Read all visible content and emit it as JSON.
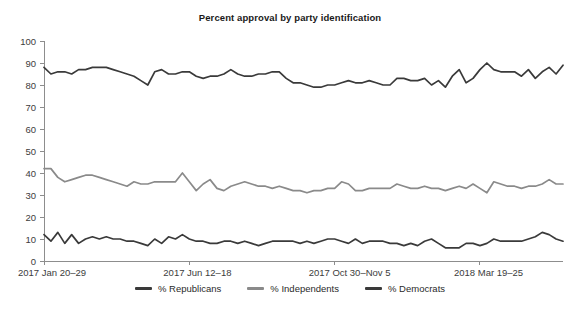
{
  "chart_data": {
    "type": "line",
    "title": "Percent approval by party identification",
    "xlabel": "",
    "ylabel": "",
    "ylim": [
      0,
      100
    ],
    "ytick_step": 10,
    "yticks": [
      0,
      10,
      20,
      30,
      40,
      50,
      60,
      70,
      80,
      90,
      100
    ],
    "grid": false,
    "legend_position": "bottom-center",
    "xtick_labels": [
      "2017 Jan 20–29",
      "2017 Jun 12–18",
      "2017 Oct 30–Nov 5",
      "2018 Mar 19–25"
    ],
    "xtick_indices": [
      0,
      21,
      42,
      63
    ],
    "n_points": 76,
    "series": [
      {
        "name": "% Republicans",
        "color": "#3a3a3a",
        "values": [
          88,
          85,
          86,
          86,
          85,
          87,
          87,
          88,
          88,
          88,
          87,
          86,
          85,
          84,
          82,
          80,
          86,
          87,
          85,
          85,
          86,
          86,
          84,
          83,
          84,
          84,
          85,
          87,
          85,
          84,
          84,
          85,
          85,
          86,
          86,
          83,
          81,
          81,
          80,
          79,
          79,
          80,
          80,
          81,
          82,
          81,
          81,
          82,
          81,
          80,
          80,
          83,
          83,
          82,
          82,
          83,
          80,
          82,
          79,
          84,
          87,
          81,
          83,
          87,
          90,
          87,
          86,
          86,
          86,
          84,
          87,
          83,
          86,
          88,
          85,
          89
        ]
      },
      {
        "name": "% Independents",
        "color": "#8a8a8a",
        "values": [
          42,
          42,
          38,
          36,
          37,
          38,
          39,
          39,
          38,
          37,
          36,
          35,
          34,
          36,
          35,
          35,
          36,
          36,
          36,
          36,
          40,
          36,
          32,
          35,
          37,
          33,
          32,
          34,
          35,
          36,
          35,
          34,
          34,
          33,
          34,
          33,
          32,
          32,
          31,
          32,
          32,
          33,
          33,
          36,
          35,
          32,
          32,
          33,
          33,
          33,
          33,
          35,
          34,
          33,
          33,
          34,
          33,
          33,
          32,
          33,
          34,
          33,
          35,
          33,
          31,
          36,
          35,
          34,
          34,
          33,
          34,
          34,
          35,
          37,
          35,
          35
        ]
      },
      {
        "name": "% Democrats",
        "color": "#3a3a3a",
        "values": [
          12,
          9,
          13,
          8,
          12,
          8,
          10,
          11,
          10,
          11,
          10,
          10,
          9,
          9,
          8,
          7,
          10,
          8,
          11,
          10,
          12,
          10,
          9,
          9,
          8,
          8,
          9,
          9,
          8,
          9,
          8,
          7,
          8,
          9,
          9,
          9,
          9,
          8,
          9,
          8,
          9,
          10,
          10,
          9,
          8,
          10,
          8,
          9,
          9,
          9,
          8,
          8,
          7,
          8,
          7,
          9,
          10,
          8,
          6,
          6,
          6,
          8,
          8,
          7,
          8,
          10,
          9,
          9,
          9,
          9,
          10,
          11,
          13,
          12,
          10,
          9
        ]
      }
    ]
  },
  "legend": {
    "items": [
      {
        "label": "% Republicans",
        "color": "#3a3a3a"
      },
      {
        "label": "% Independents",
        "color": "#8a8a8a"
      },
      {
        "label": "% Democrats",
        "color": "#3a3a3a"
      }
    ]
  }
}
